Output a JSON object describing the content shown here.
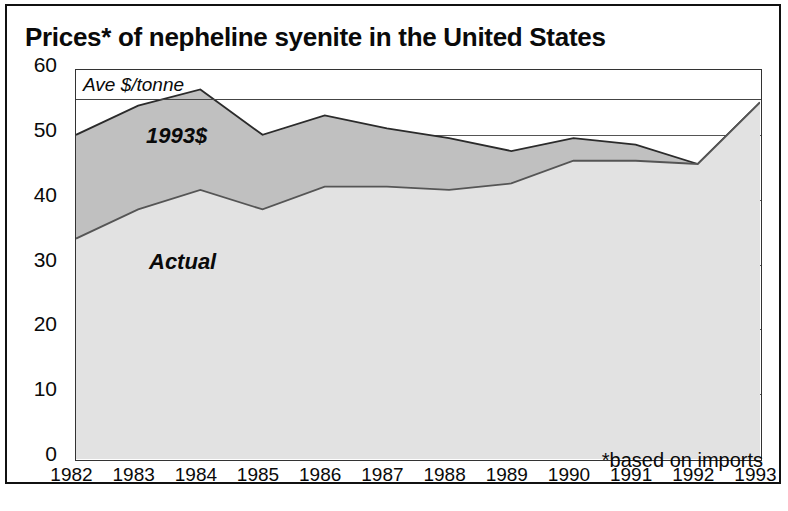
{
  "chart_data": {
    "type": "area",
    "title": "Prices* of nepheline syenite in the United States",
    "xlabel": "",
    "ylabel": "Ave $/tonne",
    "unit_note": "Ave $/tonne",
    "footnote": "*based on imports",
    "ylim": [
      0,
      60
    ],
    "yticks": [
      0,
      10,
      20,
      30,
      40,
      50,
      60
    ],
    "grid": true,
    "legend_position": "inline-annotations",
    "categories": [
      "1982",
      "1983",
      "1984",
      "1985",
      "1986",
      "1987",
      "1988",
      "1989",
      "1990",
      "1991",
      "1992",
      "1993"
    ],
    "x": [
      1982,
      1983,
      1984,
      1985,
      1986,
      1987,
      1988,
      1989,
      1990,
      1991,
      1992,
      1993
    ],
    "series": [
      {
        "name": "1993$",
        "label": "1993$",
        "fill_color": "#c0c0c0",
        "line_color": "#2b2b2b",
        "values": [
          50.0,
          54.5,
          57.0,
          50.0,
          53.0,
          51.0,
          49.5,
          47.5,
          49.5,
          48.5,
          45.5,
          55.0
        ]
      },
      {
        "name": "Actual",
        "label": "Actual",
        "fill_color": "#e2e2e2",
        "line_color": "#555555",
        "values": [
          34.0,
          38.5,
          41.5,
          38.5,
          42.0,
          42.0,
          41.5,
          42.5,
          46.0,
          46.0,
          45.5,
          55.0
        ]
      }
    ]
  },
  "axis": {
    "y_tick_labels": [
      "60",
      "50",
      "40",
      "30",
      "20",
      "10",
      "0"
    ],
    "x_tick_labels": [
      "1982",
      "1983",
      "1984",
      "1985",
      "1986",
      "1987",
      "1988",
      "1989",
      "1990",
      "1991",
      "1992",
      "1993"
    ]
  },
  "annotations": {
    "unit": "Ave $/tonne",
    "upper_series": "1993$",
    "lower_series": "Actual",
    "footnote": "*based on imports"
  },
  "colors": {
    "band_1993": "#c0c0c0",
    "band_actual": "#e2e2e2",
    "frame": "#111111",
    "text": "#0a0a0a"
  }
}
